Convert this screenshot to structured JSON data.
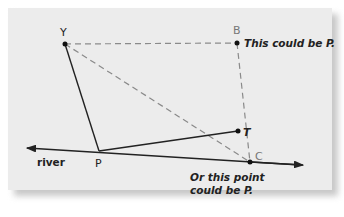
{
  "diagram": {
    "points": {
      "Y": {
        "label": "Y",
        "x": 65,
        "y": 44
      },
      "B": {
        "label": "B",
        "x": 237,
        "y": 43
      },
      "P": {
        "label": "P",
        "x": 99,
        "y": 151
      },
      "T": {
        "label": "T",
        "x": 238,
        "y": 131
      },
      "C": {
        "label": "C",
        "x": 250,
        "y": 162
      }
    },
    "river_label": "river",
    "note_b": "This could be P.",
    "note_c_line1": "Or this point",
    "note_c_line2": "could be P.",
    "colors": {
      "panel": "#ececec",
      "line": "#222222",
      "dashed": "#8a8a8a",
      "label_gray": "#777777"
    }
  }
}
